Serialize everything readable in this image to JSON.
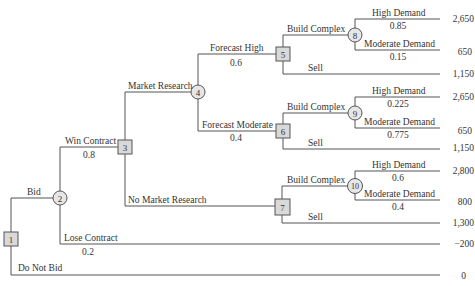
{
  "diagram": {
    "type": "decision-tree",
    "nodes": [
      {
        "id": "1",
        "kind": "decision"
      },
      {
        "id": "2",
        "kind": "chance"
      },
      {
        "id": "3",
        "kind": "decision"
      },
      {
        "id": "4",
        "kind": "chance"
      },
      {
        "id": "5",
        "kind": "decision"
      },
      {
        "id": "6",
        "kind": "decision"
      },
      {
        "id": "7",
        "kind": "decision"
      },
      {
        "id": "8",
        "kind": "chance"
      },
      {
        "id": "9",
        "kind": "chance"
      },
      {
        "id": "10",
        "kind": "chance"
      }
    ],
    "branches": {
      "bid": {
        "label": "Bid"
      },
      "do_not_bid": {
        "label": "Do Not Bid",
        "payoff": "0"
      },
      "win_contract": {
        "label": "Win Contract",
        "prob": "0.8"
      },
      "lose_contract": {
        "label": "Lose Contract",
        "prob": "0.2",
        "payoff": "−200"
      },
      "market_research": {
        "label": "Market Research"
      },
      "no_market_research": {
        "label": "No Market Research"
      },
      "forecast_high": {
        "label": "Forecast High",
        "prob": "0.6"
      },
      "forecast_moderate": {
        "label": "Forecast Moderate",
        "prob": "0.4"
      },
      "n5_build": {
        "label": "Build Complex"
      },
      "n5_sell": {
        "label": "Sell",
        "payoff": "1,150"
      },
      "n6_build": {
        "label": "Build Complex"
      },
      "n6_sell": {
        "label": "Sell",
        "payoff": "1,150"
      },
      "n7_build": {
        "label": "Build Complex"
      },
      "n7_sell": {
        "label": "Sell",
        "payoff": "1,300"
      },
      "n8_high": {
        "label": "High Demand",
        "prob": "0.85",
        "payoff": "2,650"
      },
      "n8_mod": {
        "label": "Moderate Demand",
        "prob": "0.15",
        "payoff": "650"
      },
      "n9_high": {
        "label": "High Demand",
        "prob": "0.225",
        "payoff": "2,650"
      },
      "n9_mod": {
        "label": "Moderate Demand",
        "prob": "0.775",
        "payoff": "650"
      },
      "n10_high": {
        "label": "High Demand",
        "prob": "0.6",
        "payoff": "2,800"
      },
      "n10_mod": {
        "label": "Moderate Demand",
        "prob": "0.4",
        "payoff": "800"
      }
    }
  }
}
